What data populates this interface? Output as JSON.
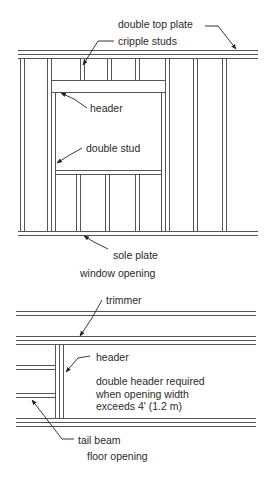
{
  "window_opening": {
    "caption": "window opening",
    "labels": {
      "double_top_plate": "double top plate",
      "cripple_studs": "cripple studs",
      "header": "header",
      "double_stud": "double stud",
      "sole_plate": "sole plate"
    }
  },
  "floor_opening": {
    "caption": "floor opening",
    "labels": {
      "trimmer": "trimmer",
      "header": "header",
      "note_line1": "double header required",
      "note_line2": "when opening width",
      "note_line3": "exceeds 4' (1.2 m)",
      "tail_beam": "tail beam"
    }
  },
  "colors": {
    "line": "#555555",
    "text": "#2a2a2a",
    "background": "#ffffff"
  }
}
